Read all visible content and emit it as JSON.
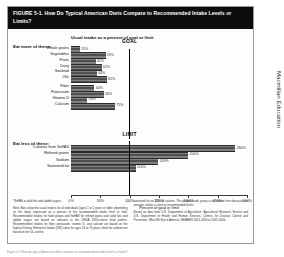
{
  "figure": {
    "title": "FIGURE 5-1. How Do Typical American Diets Compare to Recommended Intake Levels or Limits?",
    "subtitle": "Usual intake as a percent of goal or limit",
    "publisher": "Macmillan Education",
    "page_edge_text": "Figure 5-1  How do typical American diets compare to recommended intake levels or limits?"
  },
  "chart_data": {
    "type": "bar",
    "title": "Usual intake as a percent of goal or limit",
    "xlabel": "Percent of goal or limit",
    "ylabel": "",
    "orientation": "horizontal",
    "xlim": [
      0,
      300
    ],
    "xticks": [
      0,
      50,
      100,
      150,
      200,
      250,
      300
    ],
    "xtick_labels": [
      "0%",
      "50%",
      "100%",
      "150%",
      "200%",
      "250%",
      "300%"
    ],
    "grid": false,
    "legend": "none",
    "reference_lines": [
      {
        "label": "GOAL",
        "value": 100,
        "section": "eat-more"
      },
      {
        "label": "LIMIT",
        "value": 100,
        "section": "eat-less"
      }
    ],
    "groups": [
      {
        "heading": "Eat more of these:",
        "categories": [
          "Whole grains",
          "Vegetables",
          "Fruits",
          "Dairy",
          "Seafood",
          "Oils",
          "Fiber",
          "Potassium",
          "Vitamin D",
          "Calcium"
        ],
        "values": [
          15,
          59,
          42,
          52,
          44,
          61,
          40,
          56,
          28,
          75
        ],
        "value_labels": [
          "15%",
          "59%",
          "42%",
          "52%",
          "44%",
          "61%",
          "40%",
          "56%",
          "28%",
          "75%"
        ]
      },
      {
        "heading": "Eat less of these:",
        "categories": [
          "Calories from SoFAS",
          "Refined grains",
          "Sodium",
          "Saturated fat"
        ],
        "values": [
          280,
          200,
          149,
          110
        ],
        "value_labels": [
          "280%",
          "200%",
          "149%",
          "110%"
        ]
      }
    ]
  },
  "notes": {
    "left": [
      "*SoFAS = solid fats and added sugars.",
      "Note: Bars show the usual intakes for all individuals (ages 1 or 2 years or older, depending on the data) expressed as a percent of the recommended intake level or limit. Recommended intakes for food groups and SoFAS for refined grains and solid fats and added sugars are based on amounts in the USDA 2000-calorie food pattern. Recommended intakes for fiber, potassium, vitamin D, and calcium are based on the highest Dietary Reference Intake (DRI) value for ages 14 to 70 years; limits for sodium are based on the UL and for"
    ],
    "right": [
      "saturated fat on 10% of calories. The protein foods group is not shown here because, on average, intake is close to recommended levels.",
      "Based on data from U.S. Department of Agriculture, Agricultural Research Service and U.S. Department of Health and Human Services, Centers for Disease Control and Prevention, What We Eat in America, NHANES 2001-2004 or 2005-2006."
    ]
  }
}
